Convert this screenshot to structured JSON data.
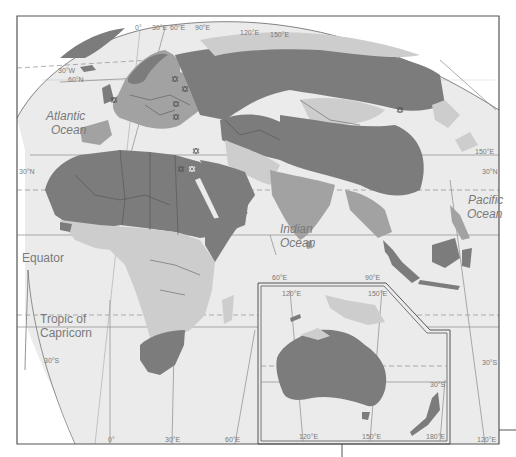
{
  "map": {
    "title": "",
    "colors": {
      "ocean": "#ebebeb",
      "outside": "#ffffff",
      "dark_region": "#7c7c7c",
      "mid_region": "#a2a2a2",
      "light_region": "#cdcdcd",
      "frame": "#555555",
      "border": "#4a4a4a",
      "text": "#7a7a7a"
    },
    "oceans": [
      {
        "label_line1": "Atlantic",
        "label_line2": "Ocean"
      },
      {
        "label_line1": "Indian",
        "label_line2": "Ocean"
      },
      {
        "label_line1": "Pacific",
        "label_line2": "Ocean"
      }
    ],
    "lines": {
      "equator": "Equator",
      "tropic_capricorn_line1": "Tropic of",
      "tropic_capricorn_line2": "Capricorn"
    },
    "top_ticks": [
      "0°",
      "30°E",
      "60°E",
      "90°E",
      "120°E",
      "150°E"
    ],
    "left_ticks": [
      "30°W",
      "60°N",
      "30°N"
    ],
    "right_ticks": [
      "150°E",
      "30°N",
      "30°S"
    ],
    "bottom_ticks": [
      "0°",
      "30°E",
      "60°E",
      "120°E"
    ],
    "middle_ticks": [
      "60°E",
      "90°E",
      "30°S"
    ],
    "inset": {
      "top_ticks": [
        "120°E",
        "150°E"
      ],
      "bottom_ticks": [
        "120°E",
        "150°E",
        "180°E"
      ],
      "lat_tick": "30°S"
    },
    "legend_symbol": "star-of-david"
  }
}
